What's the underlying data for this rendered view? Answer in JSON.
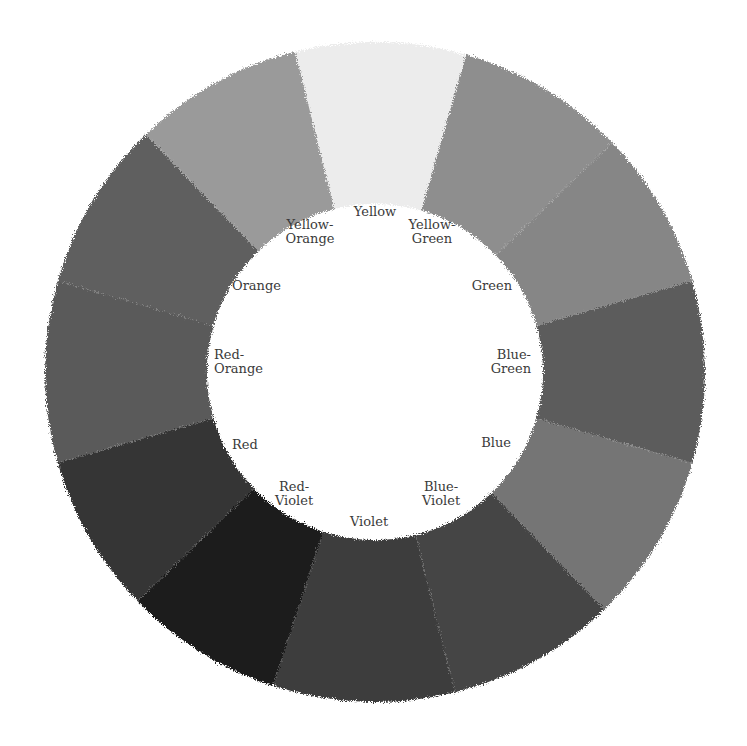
{
  "diagram": {
    "center": [
      375,
      372
    ],
    "outer_radius": 330,
    "inner_radius": 168,
    "segments": [
      {
        "name": "Yellow",
        "label": "Yellow",
        "start_deg": -14,
        "end_deg": 16,
        "gray": "#ececec",
        "label_pos": [
          375,
          212
        ],
        "align": "center"
      },
      {
        "name": "Yellow-Green",
        "label": "Yellow-\nGreen",
        "start_deg": 16,
        "end_deg": 46,
        "gray": "#8e8e8e",
        "label_pos": [
          432,
          232
        ],
        "align": "center"
      },
      {
        "name": "Green",
        "label": "Green",
        "start_deg": 46,
        "end_deg": 74,
        "gray": "#868686",
        "label_pos": [
          512,
          286
        ],
        "align": "right"
      },
      {
        "name": "Blue-Green",
        "label": "Blue-\nGreen",
        "start_deg": 74,
        "end_deg": 106,
        "gray": "#5c5c5c",
        "label_pos": [
          531,
          362
        ],
        "align": "right"
      },
      {
        "name": "Blue",
        "label": "Blue",
        "start_deg": 106,
        "end_deg": 136,
        "gray": "#747474",
        "label_pos": [
          511,
          443
        ],
        "align": "right"
      },
      {
        "name": "Blue-Violet",
        "label": "Blue-\nViolet",
        "start_deg": 136,
        "end_deg": 166,
        "gray": "#444444",
        "label_pos": [
          441,
          494
        ],
        "align": "center"
      },
      {
        "name": "Violet",
        "label": "Violet",
        "start_deg": 166,
        "end_deg": 198,
        "gray": "#3e3e3e",
        "label_pos": [
          369,
          522
        ],
        "align": "center"
      },
      {
        "name": "Red-Violet",
        "label": "Red-\nViolet",
        "start_deg": 198,
        "end_deg": 226,
        "gray": "#1a1a1a",
        "label_pos": [
          294,
          494
        ],
        "align": "center"
      },
      {
        "name": "Red",
        "label": "Red",
        "start_deg": 226,
        "end_deg": 254,
        "gray": "#353535",
        "label_pos": [
          232,
          445
        ],
        "align": "left"
      },
      {
        "name": "Red-Orange",
        "label": "Red-\nOrange",
        "start_deg": 254,
        "end_deg": 286,
        "gray": "#5a5a5a",
        "label_pos": [
          214,
          362
        ],
        "align": "left"
      },
      {
        "name": "Orange",
        "label": "Orange",
        "start_deg": 286,
        "end_deg": 316,
        "gray": "#5e5e5e",
        "label_pos": [
          232,
          286
        ],
        "align": "left"
      },
      {
        "name": "Yellow-Orange",
        "label": "Yellow-\nOrange",
        "start_deg": 316,
        "end_deg": 346,
        "gray": "#9a9a9a",
        "label_pos": [
          310,
          232
        ],
        "align": "center"
      }
    ]
  }
}
